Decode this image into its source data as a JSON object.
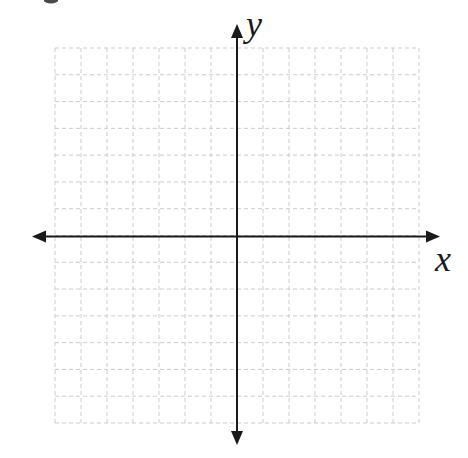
{
  "figure": {
    "background_color": "#ffffff",
    "axis_color": "#1a1a1a",
    "grid_color": "#cbcbcb",
    "x_axis_label": "x",
    "y_axis_label": "y"
  },
  "chart_data": {
    "type": "scatter",
    "title": "",
    "xlabel": "x",
    "ylabel": "y",
    "xlim": [
      -7,
      7
    ],
    "ylim": [
      -7,
      7
    ],
    "grid": true,
    "grid_divisions_x": 14,
    "grid_divisions_y": 14,
    "series": []
  }
}
